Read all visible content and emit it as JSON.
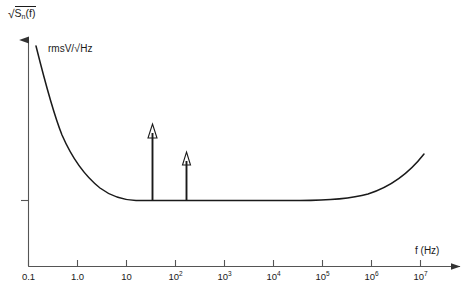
{
  "chart_data": {
    "type": "line",
    "title": "",
    "ylabel": "√Sₙ(f)",
    "ylabel_units": "rmsV/√Hz",
    "xlabel": "f (Hz)",
    "xscale": "log",
    "yscale": "linear",
    "grid": false,
    "legend": null,
    "xlim": [
      0.1,
      10000000
    ],
    "x_ticks": [
      {
        "value": 0.1,
        "label": "0.1",
        "exp": null
      },
      {
        "value": 1.0,
        "label": "1.0",
        "exp": null
      },
      {
        "value": 10,
        "label": "10",
        "exp": null
      },
      {
        "value": 100,
        "label": "10",
        "exp": "2"
      },
      {
        "value": 1000,
        "label": "10",
        "exp": "3"
      },
      {
        "value": 10000,
        "label": "10",
        "exp": "4"
      },
      {
        "value": 100000,
        "label": "10",
        "exp": "5"
      },
      {
        "value": 1000000,
        "label": "10",
        "exp": "6"
      },
      {
        "value": 10000000,
        "label": "10",
        "exp": "7"
      }
    ],
    "y_ticks": [
      {
        "value": 1.0,
        "label": ""
      }
    ],
    "series": [
      {
        "name": "noise-spectral-density",
        "description": "1/f flicker noise at low frequency, flat thermal noise floor mid-band, rising tail at high frequency",
        "x": [
          0.1,
          0.13,
          0.17,
          0.22,
          0.3,
          0.42,
          0.6,
          0.9,
          1.4,
          2.2,
          3.5,
          6,
          10,
          20,
          50,
          100,
          1000,
          10000,
          100000,
          1000000,
          2000000,
          4000000,
          7000000,
          10000000
        ],
        "y": [
          7.3,
          6.4,
          5.5,
          4.7,
          4.0,
          3.35,
          2.8,
          2.3,
          1.9,
          1.6,
          1.35,
          1.18,
          1.08,
          1.02,
          1.0,
          1.0,
          1.0,
          1.0,
          1.0,
          1.04,
          1.2,
          1.6,
          2.4,
          3.1
        ]
      }
    ],
    "spikes": [
      {
        "name": "spectral-line-1",
        "x": 30,
        "y_top": 4.1,
        "label": ""
      },
      {
        "name": "spectral-line-2",
        "x": 150,
        "y_top": 2.85,
        "label": ""
      }
    ],
    "axis_arrows": {
      "x": "right",
      "y": "up"
    },
    "line_color": "#1a1a1a",
    "axis_color": "#555555",
    "background": "#ffffff"
  },
  "figure": {
    "y_axis_label_radical": "√",
    "y_axis_label_body": "S",
    "y_axis_label_sub": "n",
    "y_axis_label_tail": "(f)",
    "units_text_a": "rmsV/",
    "units_text_rad": "√",
    "units_text_b": "Hz",
    "x_axis_label": "f (Hz)"
  }
}
